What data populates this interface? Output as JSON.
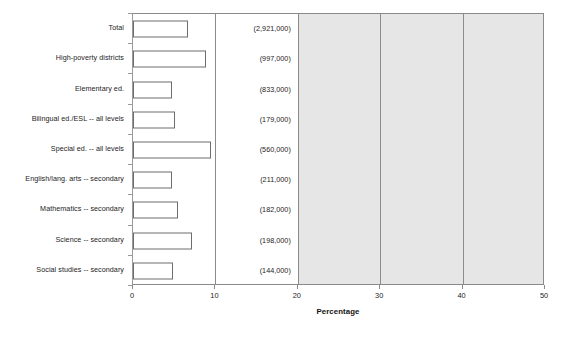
{
  "chart_data": {
    "type": "bar",
    "orientation": "horizontal",
    "title": "",
    "xlabel": "Percentage",
    "ylabel": "",
    "xlim": [
      0,
      50
    ],
    "xticks": [
      0,
      10,
      20,
      30,
      40,
      50
    ],
    "grid": true,
    "grid_axis": "x",
    "legend": "none",
    "shaded_region": {
      "from": 20,
      "to": 50,
      "color": "#e6e6e6"
    },
    "categories": [
      "Total",
      "High-poverty districts",
      "Elementary ed.",
      "Bilingual ed./ESL -- all levels",
      "Special ed. -- all levels",
      "English/lang. arts -- secondary",
      "Mathematics -- secondary",
      "Science -- secondary",
      "Social studies -- secondary"
    ],
    "values": [
      6.7,
      8.9,
      4.7,
      5.1,
      9.5,
      4.7,
      5.5,
      7.1,
      4.9
    ],
    "annotations": [
      "(2,921,000)",
      "(997,000)",
      "(833,000)",
      "(179,000)",
      "(560,000)",
      "(211,000)",
      "(182,000)",
      "(198,000)",
      "(144,000)"
    ]
  },
  "axis": {
    "x_tick_labels": [
      "0",
      "10",
      "20",
      "30",
      "40",
      "50"
    ],
    "x_title": "Percentage"
  },
  "colors": {
    "bar_fill": "#ffffff",
    "bar_stroke": "#6d6d6d",
    "shade": "#e6e6e6",
    "gridline": "#8c8c8c",
    "axis": "#8a8a8a",
    "text": "#1c1c1c"
  }
}
